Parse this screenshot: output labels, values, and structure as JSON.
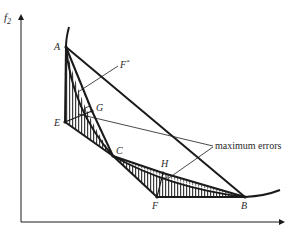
{
  "diagram": {
    "axes": {
      "y_label": "f",
      "y_label_sub": "2",
      "x_label": ""
    },
    "points": {
      "A": {
        "label": "A",
        "x": 66,
        "y": 47
      },
      "E": {
        "label": "E",
        "x": 65,
        "y": 122
      },
      "G": {
        "label": "G",
        "x": 92,
        "y": 111
      },
      "C": {
        "label": "C",
        "x": 113,
        "y": 156
      },
      "H": {
        "label": "H",
        "x": 163,
        "y": 173
      },
      "F": {
        "label": "F",
        "x": 157,
        "y": 197
      },
      "B": {
        "label": "B",
        "x": 245,
        "y": 197
      }
    },
    "annotations": {
      "fstar_label": "F",
      "fstar_sup": "*",
      "max_errors_label": "maximum errors"
    },
    "colors": {
      "ink": "#1a1a1a",
      "background": "#ffffff"
    }
  }
}
